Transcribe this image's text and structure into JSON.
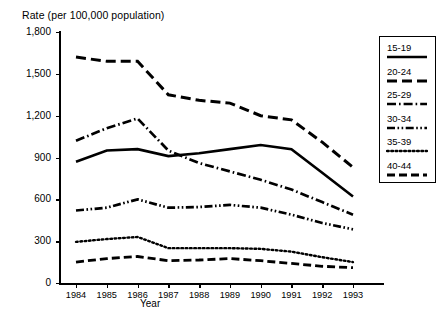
{
  "chart_data": {
    "type": "line",
    "title": "",
    "ylabel": "Rate (per 100,000 population)",
    "xlabel": "Year",
    "categories": [
      "1984",
      "1985",
      "1986",
      "1987",
      "1988",
      "1989",
      "1990",
      "1991",
      "1992",
      "1993"
    ],
    "x": [
      1984,
      1985,
      1986,
      1987,
      1988,
      1989,
      1990,
      1991,
      1992,
      1993
    ],
    "ylim": [
      0,
      1800
    ],
    "yticks": [
      0,
      300,
      600,
      900,
      1200,
      1500,
      1800
    ],
    "ytick_labels": [
      "0",
      "300",
      "600",
      "900",
      "1,200",
      "1,500",
      "1,800"
    ],
    "grid": false,
    "legend_position": "right",
    "series": [
      {
        "name": "15-19",
        "style": "solid",
        "values": [
          870,
          950,
          960,
          910,
          930,
          960,
          990,
          960,
          790,
          620
        ]
      },
      {
        "name": "20-24",
        "style": "dashed",
        "values": [
          1620,
          1590,
          1590,
          1350,
          1310,
          1290,
          1200,
          1170,
          1010,
          830
        ]
      },
      {
        "name": "25-29",
        "style": "dash-dot",
        "values": [
          1020,
          1110,
          1180,
          950,
          860,
          800,
          740,
          670,
          580,
          490
        ]
      },
      {
        "name": "30-34",
        "style": "dash-dot-dot",
        "values": [
          520,
          540,
          600,
          540,
          545,
          560,
          540,
          490,
          430,
          385
        ]
      },
      {
        "name": "35-39",
        "style": "dotted",
        "values": [
          295,
          315,
          330,
          250,
          250,
          250,
          245,
          225,
          185,
          150
        ]
      },
      {
        "name": "40-44",
        "style": "long-dashed",
        "values": [
          150,
          175,
          190,
          160,
          165,
          175,
          160,
          140,
          120,
          110
        ]
      }
    ]
  },
  "legend": {
    "items": [
      {
        "label": "15-19",
        "style": "solid"
      },
      {
        "label": "20-24",
        "style": "dashed"
      },
      {
        "label": "25-29",
        "style": "dash-dot"
      },
      {
        "label": "30-34",
        "style": "dash-dot-dot"
      },
      {
        "label": "35-39",
        "style": "dotted"
      },
      {
        "label": "40-44",
        "style": "long-dashed"
      }
    ]
  },
  "colors": {
    "ink": "#000000",
    "background": "#ffffff"
  }
}
